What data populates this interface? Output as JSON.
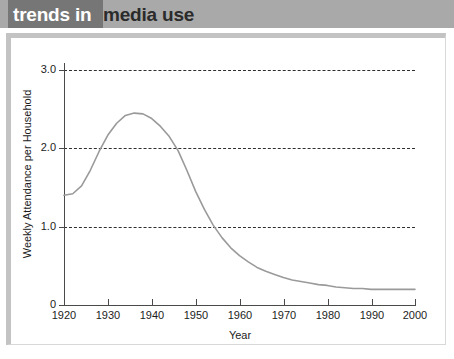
{
  "banner": {
    "title_primary": "trends in",
    "title_secondary": "media use",
    "band_dark_color": "#767676",
    "band_light_color": "#a9a9a9",
    "primary_text_color": "#ffffff",
    "secondary_text_color": "#2b2b2b"
  },
  "figure": {
    "frame_color": "#c3c3c3",
    "background_color": "#ffffff",
    "bottom_strip_color": "#e4e4e4"
  },
  "chart_data": {
    "type": "line",
    "title": "",
    "xlabel": "Year",
    "ylabel": "Weekly Attendance per Household",
    "xlim": [
      1920,
      2000
    ],
    "ylim": [
      0,
      3.1
    ],
    "xticks": [
      1920,
      1930,
      1940,
      1950,
      1960,
      1970,
      1980,
      1990,
      2000
    ],
    "xticklabels": [
      "1920",
      "1930",
      "1940",
      "1950",
      "1960",
      "1970",
      "1980",
      "1990",
      "2000"
    ],
    "yticks": [
      0,
      1.0,
      2.0,
      3.0
    ],
    "yticklabels": [
      "0",
      "1.0",
      "2.0",
      "3.0"
    ],
    "grid": true,
    "grid_axis": "y",
    "grid_style": "dashed",
    "grid_color": "#2e2e2e",
    "legend": false,
    "line_color": "#9a9a9a",
    "line_width": 1.6,
    "series": [
      {
        "name": "Weekly Attendance per Household",
        "x": [
          1920,
          1922,
          1924,
          1926,
          1928,
          1930,
          1932,
          1934,
          1936,
          1938,
          1940,
          1942,
          1944,
          1946,
          1948,
          1950,
          1952,
          1954,
          1956,
          1958,
          1960,
          1962,
          1964,
          1966,
          1968,
          1970,
          1972,
          1974,
          1976,
          1978,
          1980,
          1982,
          1984,
          1986,
          1988,
          1990,
          1992,
          1994,
          1996,
          1998,
          2000
        ],
        "values": [
          1.4,
          1.42,
          1.52,
          1.72,
          1.96,
          2.17,
          2.32,
          2.42,
          2.45,
          2.44,
          2.38,
          2.28,
          2.15,
          1.97,
          1.72,
          1.45,
          1.22,
          1.02,
          0.86,
          0.73,
          0.63,
          0.55,
          0.48,
          0.43,
          0.39,
          0.35,
          0.32,
          0.3,
          0.28,
          0.26,
          0.25,
          0.23,
          0.22,
          0.21,
          0.21,
          0.2,
          0.2,
          0.2,
          0.2,
          0.2,
          0.2
        ]
      }
    ],
    "annotations": {
      "peak_year": 1936,
      "peak_value": 2.45,
      "start_value": 1.4,
      "end_value": 0.2
    }
  }
}
